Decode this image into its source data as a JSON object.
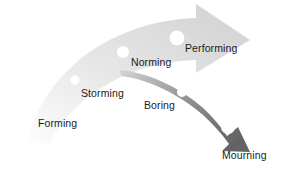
{
  "diagram": {
    "type": "two-curved-arrows",
    "canvas": {
      "width": 284,
      "height": 170,
      "background": "#ffffff"
    },
    "arrows": [
      {
        "id": "ascending-arrow",
        "name": "ascending-growth-arrow",
        "direction": "up-right",
        "gradient_from": "#fbfbfb",
        "gradient_to": "#d2d2d2",
        "tip": "right",
        "stages": [
          "Forming",
          "Storming",
          "Norming",
          "Performing"
        ]
      },
      {
        "id": "descending-arrow",
        "name": "descending-decline-arrow",
        "direction": "down-right",
        "gradient_from": "#c9c9c9",
        "gradient_to": "#676767",
        "tip": "down-right",
        "stages": [
          "Boring",
          "Mourning"
        ]
      }
    ],
    "stages": [
      {
        "id": "forming",
        "label": "Forming",
        "arrow": "ascending-arrow",
        "marker": {
          "cx": 35,
          "cy": 113,
          "r": 3.2,
          "fill": "#ffffff"
        },
        "label_pos": {
          "x": 38,
          "y": 117
        }
      },
      {
        "id": "storming",
        "label": "Storming",
        "arrow": "ascending-arrow",
        "marker": {
          "cx": 75,
          "cy": 80,
          "r": 4.6,
          "fill": "#ffffff"
        },
        "label_pos": {
          "x": 81,
          "y": 87
        }
      },
      {
        "id": "norming",
        "label": "Norming",
        "arrow": "ascending-arrow",
        "marker": {
          "cx": 123,
          "cy": 52,
          "r": 6.0,
          "fill": "#ffffff"
        },
        "label_pos": {
          "x": 131,
          "y": 56
        }
      },
      {
        "id": "performing",
        "label": "Performing",
        "arrow": "ascending-arrow",
        "marker": {
          "cx": 177,
          "cy": 38,
          "r": 7.4,
          "fill": "#ffffff"
        },
        "label_pos": {
          "x": 185,
          "y": 42
        }
      },
      {
        "id": "boring",
        "label": "Boring",
        "arrow": "descending-arrow",
        "marker": {
          "cx": 182,
          "cy": 92,
          "r": 5.0,
          "fill": "#ffffff"
        },
        "label_pos": {
          "x": 144,
          "y": 99
        }
      },
      {
        "id": "mourning",
        "label": "Mourning",
        "arrow": "descending-arrow",
        "marker": {
          "cx": 228,
          "cy": 127,
          "r": 7.0,
          "fill": "#ffffff"
        },
        "label_pos": {
          "x": 222,
          "y": 149
        }
      }
    ]
  }
}
